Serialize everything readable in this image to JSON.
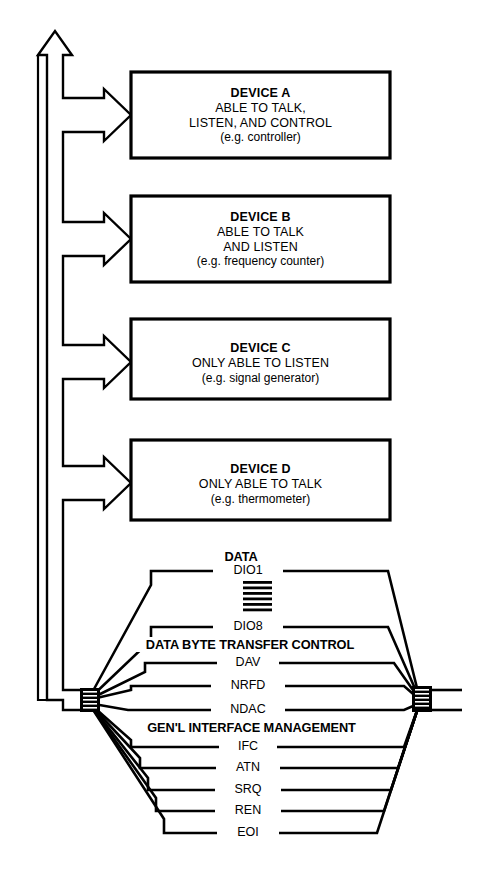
{
  "diagram": {
    "stroke_color": "#000000",
    "background_color": "#ffffff",
    "devices": [
      {
        "id": "device-a",
        "title": "DEVICE A",
        "lines": [
          "ABLE TO TALK,",
          "LISTEN, AND CONTROL"
        ],
        "example": "(e.g. controller)"
      },
      {
        "id": "device-b",
        "title": "DEVICE B",
        "lines": [
          "ABLE TO TALK",
          "AND LISTEN"
        ],
        "example": "(e.g. frequency counter)"
      },
      {
        "id": "device-c",
        "title": "DEVICE C",
        "lines": [
          "ONLY ABLE TO LISTEN"
        ],
        "example": "(e.g. signal generator)"
      },
      {
        "id": "device-d",
        "title": "DEVICE D",
        "lines": [
          "ONLY ABLE TO TALK"
        ],
        "example": "(e.g. thermometer)"
      }
    ],
    "bus_groups": [
      {
        "id": "data",
        "label": "DATA",
        "signals": [
          "DIO1",
          "DIO8"
        ],
        "ellipsis_hatch": true
      },
      {
        "id": "data-byte-transfer-control",
        "label": "DATA BYTE TRANSFER CONTROL",
        "signals": [
          "DAV",
          "NRFD",
          "NDAC"
        ]
      },
      {
        "id": "general-interface-management",
        "label": "GEN'L INTERFACE MANAGEMENT",
        "signals": [
          "IFC",
          "ATN",
          "SRQ",
          "REN",
          "EOI"
        ]
      }
    ]
  }
}
